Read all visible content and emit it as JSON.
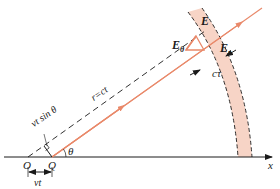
{
  "diagram": {
    "labels": {
      "E": "E",
      "E_theta_base": "E",
      "E_theta_sub": "θ",
      "E_r_base": "E",
      "E_r_sub": "r",
      "c_tau": "cτ",
      "r_ct": "r=ct",
      "vt_sin_theta": "vt sin θ",
      "theta": "θ",
      "O": "O",
      "Q": "Q",
      "vt": "vt",
      "x_axis": "x"
    },
    "colors": {
      "shell_fill": "#f7d4c6",
      "orange_line": "#e9896a",
      "black": "#1a1a1a"
    }
  }
}
